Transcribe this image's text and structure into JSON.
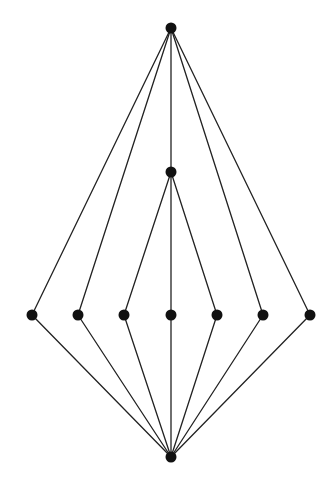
{
  "diagram": {
    "type": "hasse-diagram",
    "background": "#ffffff",
    "edge_color": "#222222",
    "node_color": "#111111",
    "node_radius": 5.5,
    "edge_width": 1.3,
    "nodes": [
      {
        "id": "top",
        "x": 171,
        "y": 28
      },
      {
        "id": "mid",
        "x": 171,
        "y": 172
      },
      {
        "id": "a1",
        "x": 32,
        "y": 315
      },
      {
        "id": "a2",
        "x": 78,
        "y": 315
      },
      {
        "id": "a3",
        "x": 124,
        "y": 315
      },
      {
        "id": "a4",
        "x": 171,
        "y": 315
      },
      {
        "id": "a5",
        "x": 217,
        "y": 315
      },
      {
        "id": "a6",
        "x": 263,
        "y": 315
      },
      {
        "id": "a7",
        "x": 310,
        "y": 315
      },
      {
        "id": "bottom",
        "x": 171,
        "y": 457
      }
    ],
    "edges": [
      [
        "top",
        "a1"
      ],
      [
        "top",
        "a2"
      ],
      [
        "top",
        "mid"
      ],
      [
        "top",
        "a6"
      ],
      [
        "top",
        "a7"
      ],
      [
        "mid",
        "a3"
      ],
      [
        "mid",
        "a4"
      ],
      [
        "mid",
        "a5"
      ],
      [
        "a1",
        "bottom"
      ],
      [
        "a2",
        "bottom"
      ],
      [
        "a3",
        "bottom"
      ],
      [
        "a4",
        "bottom"
      ],
      [
        "a5",
        "bottom"
      ],
      [
        "a6",
        "bottom"
      ],
      [
        "a7",
        "bottom"
      ]
    ]
  }
}
